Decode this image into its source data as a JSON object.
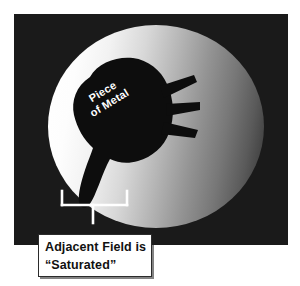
{
  "figure": {
    "name": "metal-artifact-field-diagram",
    "frame": {
      "background_color": "#1a1a1a"
    },
    "field_disc": {
      "label": "magnetic-field-gradient-disc",
      "gradient_from": "#ffffff",
      "gradient_to": "#2a2a2a",
      "gradient_angle_deg": 100
    },
    "metal_object": {
      "fill_color": "#0d0d0d",
      "caption_line1": "Piece",
      "caption_line2": "of Metal",
      "caption_color": "#ffffff",
      "caption_rotation_deg": -31,
      "prong_count": 3
    },
    "brace": {
      "color": "#ffffff",
      "label": "saturation-extent-brace"
    },
    "callout": {
      "line1": "Adjacent Field is",
      "line2": "“Saturated”",
      "border_color": "#2b2b2b",
      "fill_color": "#ffffff",
      "text_color": "#111111"
    }
  }
}
